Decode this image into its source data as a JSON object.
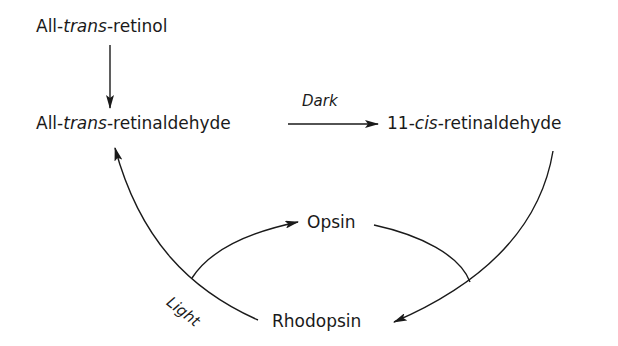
{
  "diagram": {
    "nodes": {
      "retinol": {
        "prefix": "All-",
        "italic": "trans",
        "suffix": "-retinol"
      },
      "trans_retinal": {
        "prefix": "All-",
        "italic": "trans",
        "suffix": "-retinaldehyde"
      },
      "cis_retinal": {
        "prefix": "11-",
        "italic": "cis",
        "suffix": "-retinaldehyde"
      },
      "opsin": {
        "text": "Opsin"
      },
      "rhodopsin": {
        "text": "Rhodopsin"
      }
    },
    "conditions": {
      "dark": "Dark",
      "light": "Light"
    },
    "edges": [
      {
        "from": "All-trans-retinol",
        "to": "All-trans-retinaldehyde",
        "label": ""
      },
      {
        "from": "All-trans-retinaldehyde",
        "to": "11-cis-retinaldehyde",
        "label": "Dark"
      },
      {
        "from": "11-cis-retinaldehyde",
        "to": "Rhodopsin",
        "label": ""
      },
      {
        "from": "Opsin",
        "to": "Rhodopsin",
        "label": ""
      },
      {
        "from": "Rhodopsin",
        "to": "All-trans-retinaldehyde",
        "label": "Light"
      },
      {
        "from": "Rhodopsin",
        "to": "Opsin",
        "label": "Light"
      }
    ],
    "colors": {
      "ink": "#1a1a1a",
      "background": "#ffffff"
    }
  }
}
